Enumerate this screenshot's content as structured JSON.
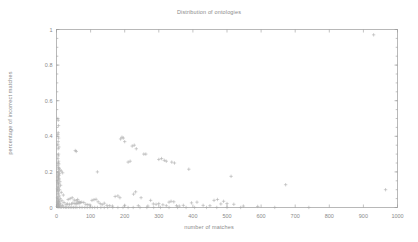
{
  "chart_data": {
    "type": "scatter",
    "title": "Distribution of ontologies",
    "xlabel": "number of matches",
    "ylabel": "percentage of incorrect matches",
    "xlim": [
      0,
      1000
    ],
    "ylim": [
      0,
      1
    ],
    "xticks": [
      0,
      100,
      200,
      300,
      400,
      500,
      600,
      700,
      800,
      900,
      1000
    ],
    "xticklabels": [
      "0",
      "100",
      "200",
      "300",
      "400",
      "500",
      "600",
      "700",
      "800",
      "900",
      "1000"
    ],
    "yticks": [
      0,
      0.2,
      0.4,
      0.6,
      0.8,
      1
    ],
    "yticklabels": [
      "0",
      "0.2",
      "0.4",
      "0.6",
      "0.8",
      "1"
    ],
    "grid": false,
    "legend": false,
    "marker": "plus",
    "marker_color": "#a8a8a8",
    "series": [
      {
        "name": "ontologies",
        "points": [
          [
            4,
            0.5
          ],
          [
            5,
            0.49
          ],
          [
            6,
            0.46
          ],
          [
            5,
            0.42
          ],
          [
            4,
            0.41
          ],
          [
            6,
            0.39
          ],
          [
            5,
            0.37
          ],
          [
            4,
            0.355
          ],
          [
            7,
            0.34
          ],
          [
            5,
            0.33
          ],
          [
            55,
            0.32
          ],
          [
            58,
            0.315
          ],
          [
            6,
            0.3
          ],
          [
            5,
            0.29
          ],
          [
            4,
            0.275
          ],
          [
            6,
            0.26
          ],
          [
            5,
            0.25
          ],
          [
            7,
            0.245
          ],
          [
            4,
            0.235
          ],
          [
            6,
            0.225
          ],
          [
            8,
            0.22
          ],
          [
            5,
            0.215
          ],
          [
            10,
            0.21
          ],
          [
            14,
            0.205
          ],
          [
            6,
            0.2
          ],
          [
            4,
            0.195
          ],
          [
            18,
            0.195
          ],
          [
            9,
            0.19
          ],
          [
            5,
            0.185
          ],
          [
            7,
            0.18
          ],
          [
            120,
            0.2
          ],
          [
            5,
            0.175
          ],
          [
            4,
            0.17
          ],
          [
            6,
            0.165
          ],
          [
            8,
            0.16
          ],
          [
            5,
            0.155
          ],
          [
            3,
            0.15
          ],
          [
            10,
            0.145
          ],
          [
            4,
            0.14
          ],
          [
            6,
            0.135
          ],
          [
            5,
            0.13
          ],
          [
            12,
            0.125
          ],
          [
            4,
            0.12
          ],
          [
            7,
            0.115
          ],
          [
            5,
            0.11
          ],
          [
            3,
            0.105
          ],
          [
            9,
            0.1
          ],
          [
            5,
            0.095
          ],
          [
            4,
            0.09
          ],
          [
            14,
            0.085
          ],
          [
            6,
            0.08
          ],
          [
            4,
            0.075
          ],
          [
            20,
            0.07
          ],
          [
            8,
            0.065
          ],
          [
            5,
            0.06
          ],
          [
            3,
            0.055
          ],
          [
            11,
            0.05
          ],
          [
            6,
            0.045
          ],
          [
            4,
            0.04
          ],
          [
            16,
            0.038
          ],
          [
            9,
            0.035
          ],
          [
            5,
            0.032
          ],
          [
            3,
            0.03
          ],
          [
            22,
            0.028
          ],
          [
            7,
            0.025
          ],
          [
            4,
            0.022
          ],
          [
            12,
            0.02
          ],
          [
            6,
            0.018
          ],
          [
            3,
            0.015
          ],
          [
            18,
            0.012
          ],
          [
            9,
            0.01
          ],
          [
            5,
            0.008
          ],
          [
            2,
            0.006
          ],
          [
            4,
            0.004
          ],
          [
            7,
            0.003
          ],
          [
            11,
            0.002
          ],
          [
            15,
            0.002
          ],
          [
            21,
            0.0015
          ],
          [
            26,
            0.001
          ],
          [
            30,
            0.001
          ],
          [
            35,
            0.001
          ],
          [
            40,
            0.0008
          ],
          [
            45,
            0.0008
          ],
          [
            50,
            0.0005
          ],
          [
            55,
            0.0005
          ],
          [
            60,
            0.0005
          ],
          [
            68,
            0.0005
          ],
          [
            75,
            0.0005
          ],
          [
            83,
            0.0003
          ],
          [
            90,
            0.0003
          ],
          [
            98,
            0.0003
          ],
          [
            105,
            0.0003
          ],
          [
            112,
            0.0002
          ],
          [
            120,
            0.0002
          ],
          [
            130,
            0.0002
          ],
          [
            140,
            0.0002
          ],
          [
            150,
            0.0002
          ],
          [
            165,
            0.0002
          ],
          [
            180,
            0.0002
          ],
          [
            195,
            0.0002
          ],
          [
            210,
            0.0002
          ],
          [
            225,
            0.0002
          ],
          [
            245,
            0.0002
          ],
          [
            265,
            0.0002
          ],
          [
            285,
            0.0002
          ],
          [
            305,
            0.0002
          ],
          [
            330,
            0.0002
          ],
          [
            355,
            0.0002
          ],
          [
            380,
            0.0002
          ],
          [
            405,
            0.0002
          ],
          [
            440,
            0.0002
          ],
          [
            470,
            0.0002
          ],
          [
            500,
            0.0002
          ],
          [
            540,
            0.0002
          ],
          [
            640,
            0.0002
          ],
          [
            740,
            0.0002
          ],
          [
            34,
            0.045
          ],
          [
            40,
            0.05
          ],
          [
            46,
            0.055
          ],
          [
            52,
            0.042
          ],
          [
            58,
            0.038
          ],
          [
            62,
            0.045
          ],
          [
            66,
            0.033
          ],
          [
            70,
            0.028
          ],
          [
            74,
            0.03
          ],
          [
            62,
            0.026
          ],
          [
            66,
            0.022
          ],
          [
            58,
            0.02
          ],
          [
            54,
            0.022
          ],
          [
            48,
            0.025
          ],
          [
            44,
            0.02
          ],
          [
            38,
            0.018
          ],
          [
            32,
            0.02
          ],
          [
            28,
            0.018
          ],
          [
            80,
            0.028
          ],
          [
            86,
            0.018
          ],
          [
            92,
            0.016
          ],
          [
            98,
            0.014
          ],
          [
            104,
            0.04
          ],
          [
            110,
            0.044
          ],
          [
            116,
            0.046
          ],
          [
            122,
            0.032
          ],
          [
            128,
            0.022
          ],
          [
            134,
            0.016
          ],
          [
            140,
            0.024
          ],
          [
            148,
            0.012
          ],
          [
            156,
            0.01
          ],
          [
            164,
            0.008
          ],
          [
            172,
            0.062
          ],
          [
            180,
            0.065
          ],
          [
            188,
            0.385
          ],
          [
            192,
            0.395
          ],
          [
            196,
            0.39
          ],
          [
            200,
            0.37
          ],
          [
            186,
            0.055
          ],
          [
            200,
            0.012
          ],
          [
            210,
            0.255
          ],
          [
            216,
            0.26
          ],
          [
            222,
            0.345
          ],
          [
            228,
            0.35
          ],
          [
            234,
            0.33
          ],
          [
            226,
            0.075
          ],
          [
            232,
            0.088
          ],
          [
            240,
            0.01
          ],
          [
            248,
            0.055
          ],
          [
            256,
            0.3
          ],
          [
            262,
            0.3
          ],
          [
            268,
            0.008
          ],
          [
            276,
            0.04
          ],
          [
            284,
            0.02
          ],
          [
            292,
            0.018
          ],
          [
            300,
            0.27
          ],
          [
            308,
            0.275
          ],
          [
            316,
            0.265
          ],
          [
            322,
            0.26
          ],
          [
            300,
            0.022
          ],
          [
            312,
            0.015
          ],
          [
            322,
            0.01
          ],
          [
            330,
            0.03
          ],
          [
            338,
            0.255
          ],
          [
            346,
            0.25
          ],
          [
            336,
            0.035
          ],
          [
            344,
            0.032
          ],
          [
            352,
            0.01
          ],
          [
            360,
            0.008
          ],
          [
            372,
            0.012
          ],
          [
            388,
            0.215
          ],
          [
            396,
            0.026
          ],
          [
            412,
            0.03
          ],
          [
            430,
            0.012
          ],
          [
            450,
            0.01
          ],
          [
            462,
            0.04
          ],
          [
            472,
            0.045
          ],
          [
            482,
            0.02
          ],
          [
            490,
            0.035
          ],
          [
            500,
            0.022
          ],
          [
            512,
            0.175
          ],
          [
            520,
            0.018
          ],
          [
            548,
            0.008
          ],
          [
            590,
            0.006
          ],
          [
            672,
            0.128
          ],
          [
            930,
            0.97
          ],
          [
            965,
            0.1
          ]
        ]
      }
    ]
  }
}
